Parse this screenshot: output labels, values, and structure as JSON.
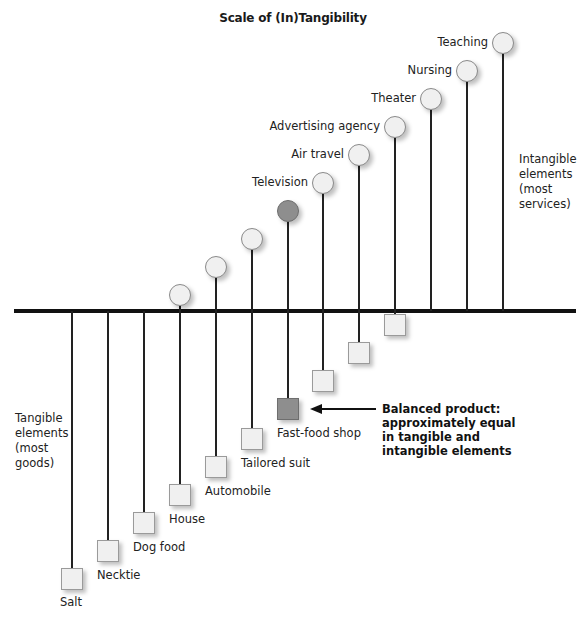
{
  "title": "Scale of (In)Tangibility",
  "side_labels": {
    "intangible": [
      "Intangible",
      "elements",
      "(most",
      "services)"
    ],
    "tangible": [
      "Tangible",
      "elements",
      "(most",
      "goods)"
    ]
  },
  "callout": {
    "lines": [
      "Balanced product:",
      "approximately equal",
      "in tangible and",
      "intangible elements"
    ]
  },
  "products": [
    {
      "name": "Salt",
      "x": 72,
      "tangible_top": 568,
      "intangible_cy": null
    },
    {
      "name": "Necktie",
      "x": 108,
      "tangible_top": 540,
      "intangible_cy": null
    },
    {
      "name": "Dog food",
      "x": 144,
      "tangible_top": 512,
      "intangible_cy": null
    },
    {
      "name": "House",
      "x": 180,
      "tangible_top": 484,
      "intangible_cy": 295
    },
    {
      "name": "Automobile",
      "x": 216,
      "tangible_top": 456,
      "intangible_cy": 267
    },
    {
      "name": "Tailored suit",
      "x": 252,
      "tangible_top": 428,
      "intangible_cy": 239
    },
    {
      "name": "Fast-food shop",
      "x": 288,
      "tangible_top": 398,
      "intangible_cy": 211,
      "balanced": true
    },
    {
      "name": "Television",
      "x": 323,
      "tangible_top": 370,
      "intangible_cy": 183
    },
    {
      "name": "Air travel",
      "x": 359,
      "tangible_top": 342,
      "intangible_cy": 155
    },
    {
      "name": "Advertising agency",
      "x": 395,
      "tangible_top": 314,
      "intangible_cy": 127
    },
    {
      "name": "Theater",
      "x": 431,
      "tangible_top": null,
      "intangible_cy": 99
    },
    {
      "name": "Nursing",
      "x": 467,
      "tangible_top": null,
      "intangible_cy": 71
    },
    {
      "name": "Teaching",
      "x": 503,
      "tangible_top": null,
      "intangible_cy": 43
    }
  ],
  "colors": {
    "shape_fill": "#f0f0f0",
    "balanced_fill": "#8e8e8e",
    "line": "#111111"
  }
}
